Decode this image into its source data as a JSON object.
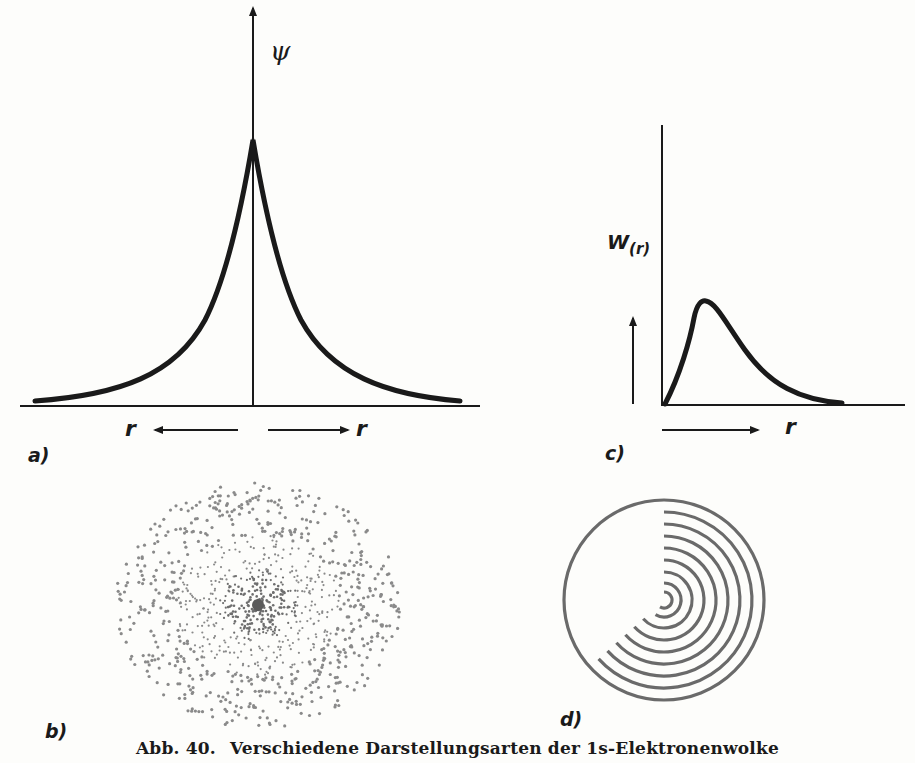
{
  "caption": {
    "number": "Abb. 40.",
    "text": "Verschiedene Darstellungsarten der 1s-Elektronenwolke"
  },
  "panels": {
    "a": {
      "label": "a)",
      "y_axis_label": "ψ",
      "x_axis_label_left": "r",
      "x_axis_label_right": "r"
    },
    "b": {
      "label": "b)"
    },
    "c": {
      "label": "c)",
      "y_axis_label": "W",
      "y_axis_subscript": "(r)",
      "x_axis_label": "r"
    },
    "d": {
      "label": "d)"
    }
  },
  "chart_data": [
    {
      "type": "line",
      "panel": "a",
      "title": "",
      "ylabel": "ψ",
      "xlabel": "r (both directions)",
      "description": "Wave function ψ of 1s electron, symmetric exponential cusp at r=0",
      "x": [
        -1.0,
        -0.8,
        -0.6,
        -0.4,
        -0.2,
        -0.1,
        0,
        0.1,
        0.2,
        0.4,
        0.6,
        0.8,
        1.0
      ],
      "values": [
        0.02,
        0.04,
        0.08,
        0.17,
        0.4,
        0.62,
        1.0,
        0.62,
        0.4,
        0.17,
        0.08,
        0.04,
        0.02
      ],
      "grid": false
    },
    {
      "type": "line",
      "panel": "c",
      "title": "",
      "ylabel": "W(r)",
      "xlabel": "r",
      "description": "Radial probability density W(r), rising from zero to a maximum then decaying",
      "x": [
        0,
        0.1,
        0.2,
        0.3,
        0.4,
        0.6,
        0.8,
        1.0
      ],
      "values": [
        0,
        0.55,
        1.0,
        0.8,
        0.55,
        0.22,
        0.05,
        0.0
      ],
      "grid": false
    }
  ]
}
